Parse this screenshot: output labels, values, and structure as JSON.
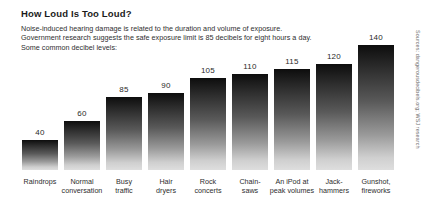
{
  "header": {
    "title": "How Loud Is Too Loud?",
    "subtitle_lines": [
      "Noise-induced hearing damage is related to the duration and volume of exposure.",
      "Government research suggests the safe exposure limit is 85 decibels for eight hours a day.",
      "Some common decibel levels:"
    ]
  },
  "source": {
    "text": "Sources: dangerousdecibels.org; WSJ research"
  },
  "chart_data": {
    "type": "bar",
    "title": "How Loud Is Too Loud?",
    "xlabel": "",
    "ylabel": "",
    "unit": "decibels",
    "grid": false,
    "legend": false,
    "ylim": [
      0,
      140
    ],
    "categories": [
      "Raindrops",
      "Normal conversation",
      "Busy traffic",
      "Hair dryers",
      "Rock concerts",
      "Chain-saws",
      "An iPod at peak volumes",
      "Jack-hammers",
      "Gunshot, fireworks"
    ],
    "category_lines": [
      [
        "Raindrops"
      ],
      [
        "Normal",
        "conversation"
      ],
      [
        "Busy",
        "traffic"
      ],
      [
        "Hair",
        "dryers"
      ],
      [
        "Rock",
        "concerts"
      ],
      [
        "Chain-",
        "saws"
      ],
      [
        "An iPod at",
        "peak volumes"
      ],
      [
        "Jack-",
        "hammers"
      ],
      [
        "Gunshot,",
        "fireworks"
      ]
    ],
    "values": [
      40,
      60,
      85,
      90,
      105,
      110,
      115,
      120,
      140
    ],
    "value_labels": [
      "40",
      "60",
      "85",
      "90",
      "105",
      "110",
      "115",
      "120",
      "140"
    ],
    "bar_fill": "gradient-black-to-light-gray",
    "bar_top_color": "#0d0d0d",
    "bar_bottom_color": "#dedede"
  }
}
